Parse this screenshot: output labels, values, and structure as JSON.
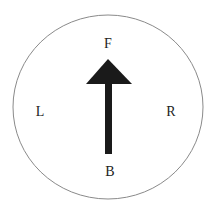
{
  "diagram": {
    "type": "direction-compass",
    "labels": {
      "front": "F",
      "back": "B",
      "left": "L",
      "right": "R"
    },
    "arrow": {
      "direction": "front",
      "color": "#1a1a1a"
    },
    "circle": {
      "stroke": "#888888"
    }
  }
}
